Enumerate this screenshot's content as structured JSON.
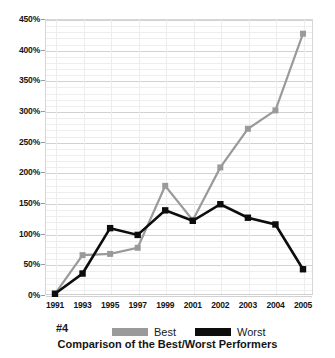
{
  "chart_data": {
    "type": "line",
    "title": "",
    "caption": "Comparison of the Best/Worst Performers",
    "tag": "#4",
    "xlabel": "",
    "ylabel": "",
    "grid": true,
    "legend_position": "bottom",
    "ylim": [
      0,
      450
    ],
    "ytick_step": 50,
    "ytick_labels": [
      "0%",
      "50%",
      "100%",
      "150%",
      "200%",
      "250%",
      "300%",
      "350%",
      "400%",
      "450%"
    ],
    "ytick_values": [
      0,
      50,
      100,
      150,
      200,
      250,
      300,
      350,
      400,
      450
    ],
    "categories": [
      "1991",
      "1993",
      "1995",
      "1997",
      "1999",
      "2001",
      "2002",
      "2003",
      "2004",
      "2005"
    ],
    "x": [
      "1991",
      "1993",
      "1995",
      "1997",
      "1999",
      "2001",
      "2002",
      "2003",
      "2004",
      "2005"
    ],
    "series": [
      {
        "name": "Best",
        "color": "#9a9a9a",
        "marker": "square",
        "values": [
          2,
          65,
          67,
          77,
          178,
          122,
          208,
          271,
          301,
          426
        ]
      },
      {
        "name": "Worst",
        "color": "#0d0d0d",
        "marker": "square",
        "values": [
          2,
          35,
          109,
          98,
          138,
          121,
          148,
          126,
          115,
          42
        ]
      }
    ]
  },
  "legend": {
    "tag": "#4",
    "entries": [
      {
        "label": "Best",
        "color": "#9a9a9a"
      },
      {
        "label": "Worst",
        "color": "#0d0d0d"
      }
    ]
  },
  "colors": {
    "best": "#9a9a9a",
    "worst": "#0d0d0d",
    "grid_major": "#d2d2d2",
    "grid_minor": "#eeeeee",
    "axis_text": "#151515",
    "background": "#ffffff"
  }
}
